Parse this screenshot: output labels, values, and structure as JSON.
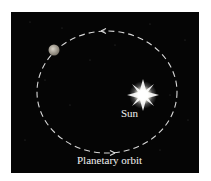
{
  "diagram": {
    "background_color": "#050505",
    "labels": {
      "sun": "Sun",
      "orbit": "Planetary orbit"
    },
    "elements": {
      "sun": {
        "icon": "star-burst-icon",
        "color": "#ffffff"
      },
      "planet": {
        "icon": "planet-icon",
        "color": "#a8a39a"
      },
      "orbit": {
        "style": "dashed",
        "color": "#d8d8d8",
        "direction": "counterclockwise"
      }
    }
  }
}
